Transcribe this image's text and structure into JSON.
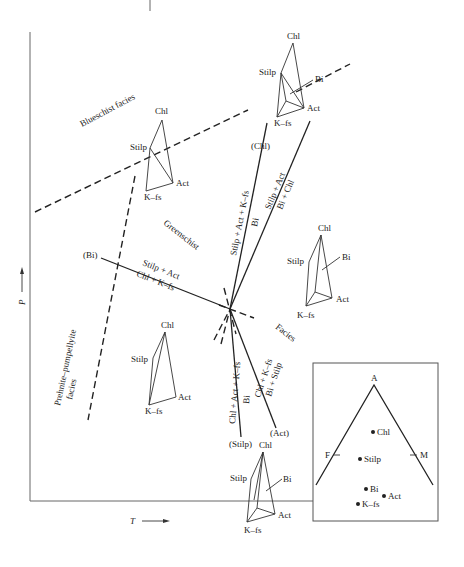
{
  "diagram": {
    "axes": {
      "y_label": "P",
      "x_label": "T"
    },
    "facies_labels": {
      "blueschist": "Blueschist facies",
      "greenschist": "Greenschist",
      "facies": "Facies",
      "prehnite_line1": "Prehnite–pumpellyite",
      "prehnite_line2": "facies"
    },
    "invariant_point_labels": {
      "bi": "(Bi)",
      "chl": "(Chl)",
      "stilp": "(Stilp)",
      "act": "(Act)"
    },
    "reactions": {
      "bi_upper": "Stilp + Act",
      "bi_lower": "Chl + K–fs",
      "chl_upper": "Stilp + Act + K–fs",
      "chl_lower": "Bi",
      "ne_upper": "Stilp + Act",
      "ne_lower": "Bi + Chl",
      "stilp_upper": "Chl + Act + K–fs",
      "stilp_lower": "Bi",
      "act_upper": "Chl + K–fs",
      "act_lower": "Bi + Stilp"
    },
    "phases": {
      "chl": "Chl",
      "stilp": "Stilp",
      "act": "Act",
      "kfs": "K–fs",
      "bi": "Bi"
    },
    "afm_inset": {
      "apex_a": "A",
      "corner_f": "F",
      "corner_m": "M",
      "points": [
        "Chl",
        "Stilp",
        "Bi",
        "Act",
        "K–fs"
      ]
    }
  }
}
